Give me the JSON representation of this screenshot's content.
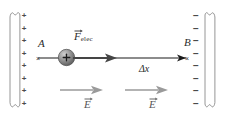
{
  "figure": {
    "type": "physics-diagram",
    "background": "#ffffff"
  },
  "left_plate": {
    "name": "positive-plate",
    "charge_symbol": "+",
    "charge_count": 8,
    "charges": [
      "+",
      "+",
      "+",
      "+",
      "+",
      "+",
      "+",
      "+"
    ],
    "color": "#7a7a7a"
  },
  "right_plate": {
    "name": "negative-plate",
    "charge_symbol": "−",
    "charge_count": 8,
    "charges": [
      "−",
      "−",
      "−",
      "−",
      "−",
      "−",
      "−",
      "−"
    ],
    "color": "#7a7a7a"
  },
  "points": {
    "start_label": "A",
    "end_label": "B",
    "marker": "×"
  },
  "particle": {
    "name": "positive-charge-ball",
    "sign": "+",
    "fill": "#8c8c8c"
  },
  "force": {
    "symbol": "F",
    "subscript": "elec",
    "vector": true,
    "color": "#4d4d4d"
  },
  "displacement": {
    "label": "Δx",
    "color": "#1a1a1a"
  },
  "field": {
    "symbol": "E",
    "vector": true,
    "color": "#8e8e8e",
    "arrows": [
      {
        "label": "E"
      },
      {
        "label": "E"
      }
    ]
  }
}
